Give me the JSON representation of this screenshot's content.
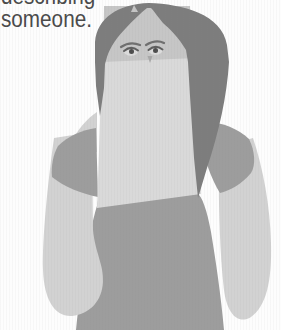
{
  "caption": {
    "line1_clipped": "describing",
    "line2": "someone."
  },
  "figure": {
    "alt": "grayscale illustration of a woman holding a blank sheet of paper covering her face below the eyes",
    "paper_label": "",
    "colors": {
      "background": "#fdfdfd",
      "hair": "#7d7d7d",
      "face": "#c6c6c6",
      "arm": "#d2d2d2",
      "shirt": "#9d9d9d",
      "paper": "#d9d9d9",
      "sclera": "#dcdcdc",
      "eye_line": "#5f5f5f",
      "pupil": "#4c4c4c",
      "brow": "#6f6f6f",
      "nose_shadow": "#a8a8a8",
      "text": "#4a4a4a"
    }
  }
}
